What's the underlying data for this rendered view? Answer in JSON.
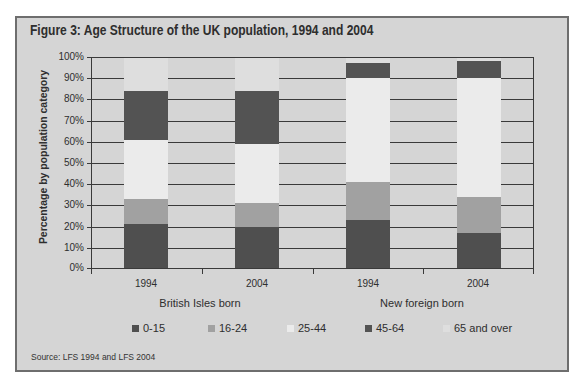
{
  "figure": {
    "title": "Figure 3: Age Structure of the UK population, 1994 and 2004",
    "source": "Source: LFS 1994 and LFS 2004"
  },
  "chart_data": {
    "type": "bar",
    "stacked": true,
    "title": "Figure 3: Age Structure of the UK population, 1994 and 2004",
    "xlabel": "",
    "ylabel": "Percentage by population category",
    "ylim": [
      0,
      100
    ],
    "yticks": [
      "0%",
      "10%",
      "20%",
      "30%",
      "40%",
      "50%",
      "60%",
      "70%",
      "80%",
      "90%",
      "100%"
    ],
    "categories": [
      "1994",
      "2004",
      "1994",
      "2004"
    ],
    "groups": [
      {
        "label": "British Isles born",
        "categories": [
          "1994",
          "2004"
        ]
      },
      {
        "label": "New foreign born",
        "categories": [
          "1994",
          "2004"
        ]
      }
    ],
    "series": [
      {
        "name": "0-15",
        "color": "#4f4f4f",
        "values": [
          21,
          20,
          23,
          17
        ]
      },
      {
        "name": "16-24",
        "color": "#a1a1a1",
        "values": [
          12,
          11,
          18,
          17
        ]
      },
      {
        "name": "25-44",
        "color": "#ebebeb",
        "values": [
          28,
          28,
          49,
          56
        ]
      },
      {
        "name": "45-64",
        "color": "#535353",
        "values": [
          23,
          25,
          7,
          8
        ]
      },
      {
        "name": "65 and over",
        "color": "#dedede",
        "values": [
          16,
          16,
          3,
          2
        ]
      }
    ],
    "grid": true,
    "legend_position": "bottom",
    "source": "Source: LFS 1994 and LFS 2004"
  },
  "colors": {
    "panel_background": "#d5d5d5",
    "gridline": "#3a3a3a",
    "border": "#6e6e6e"
  }
}
